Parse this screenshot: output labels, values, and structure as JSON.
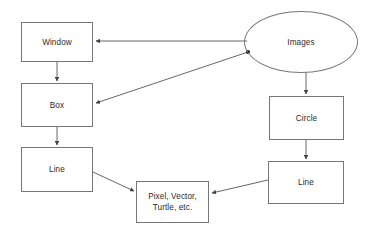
{
  "diagram": {
    "type": "flow-diagram",
    "background_color": "#ffffff",
    "node_stroke_color": "#777777",
    "edge_stroke_color": "#555555",
    "text_color": "#2b2b2b",
    "nodes": [
      {
        "id": "window",
        "label": "Window",
        "shape": "rectangle",
        "x": 21,
        "y": 22,
        "width": 72,
        "height": 40
      },
      {
        "id": "box",
        "label": "Box",
        "shape": "rectangle",
        "x": 21,
        "y": 83,
        "width": 72,
        "height": 44
      },
      {
        "id": "line-left",
        "label": "Line",
        "shape": "rectangle",
        "x": 21,
        "y": 147,
        "width": 72,
        "height": 45
      },
      {
        "id": "images",
        "label": "Images",
        "shape": "ellipse",
        "x": 244,
        "y": 11,
        "width": 114,
        "height": 62
      },
      {
        "id": "circle",
        "label": "Circle",
        "shape": "rectangle",
        "x": 269,
        "y": 96,
        "width": 75,
        "height": 44
      },
      {
        "id": "line-right",
        "label": "Line",
        "shape": "rectangle",
        "x": 268,
        "y": 161,
        "width": 76,
        "height": 43
      },
      {
        "id": "primitives",
        "label": "Pixel, Vector,\nTurtle, etc.",
        "shape": "rectangle",
        "x": 136,
        "y": 181,
        "width": 73,
        "height": 42
      }
    ],
    "edges": [
      {
        "id": "images-to-window",
        "from": "images",
        "to": "window",
        "arrow": "to"
      },
      {
        "id": "images-to-box",
        "from": "images",
        "to": "box",
        "arrow": "to"
      },
      {
        "id": "window-to-box",
        "from": "window",
        "to": "box",
        "arrow": "to"
      },
      {
        "id": "box-to-line-left",
        "from": "box",
        "to": "line-left",
        "arrow": "to"
      },
      {
        "id": "images-to-circle",
        "from": "images",
        "to": "circle",
        "arrow": "to"
      },
      {
        "id": "circle-to-line-right",
        "from": "circle",
        "to": "line-right",
        "arrow": "to"
      },
      {
        "id": "line-left-to-primitives",
        "from": "line-left",
        "to": "primitives",
        "arrow": "to"
      },
      {
        "id": "line-right-to-primitives",
        "from": "line-right",
        "to": "primitives",
        "arrow": "to"
      }
    ],
    "junction_dot": {
      "x": 248,
      "y": 52
    }
  }
}
